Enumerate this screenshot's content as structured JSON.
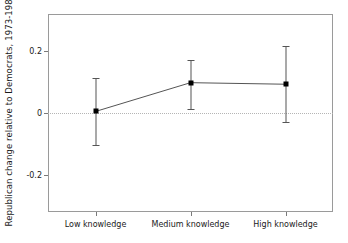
{
  "chart_data": {
    "type": "line",
    "title": "",
    "subtitle": "",
    "xlabel": "",
    "ylabel": "Republican change relative to Democrats, 1973-1982",
    "categories": [
      "Low knowledge",
      "Medium knowledge",
      "High knowledge"
    ],
    "values": [
      0.005,
      0.098,
      0.093
    ],
    "error_low": [
      -0.105,
      0.013,
      -0.028
    ],
    "error_high": [
      0.112,
      0.172,
      0.218
    ],
    "yticks": [
      0.2,
      0,
      -0.2
    ],
    "ytick_labels": [
      "0.2",
      "0",
      "-0.2"
    ],
    "ylim": [
      -0.32,
      0.32
    ],
    "grid": false,
    "legend": false,
    "legend_position": "none",
    "zero_reference_line": 0,
    "annotations": [],
    "series": [
      {
        "name": "Republican change relative to Democrats, 1973-1982",
        "values": [
          0.005,
          0.098,
          0.093
        ],
        "error_low": [
          -0.105,
          0.013,
          -0.028
        ],
        "error_high": [
          0.112,
          0.172,
          0.218
        ],
        "marker": "filled-square",
        "color": "#000000"
      }
    ]
  },
  "colors": {
    "line": "#555555",
    "marker": "#000000",
    "frame": "#9a9a9a",
    "zero_line": "#b5b5b5",
    "text": "#1a1a1a",
    "background": "#ffffff"
  }
}
